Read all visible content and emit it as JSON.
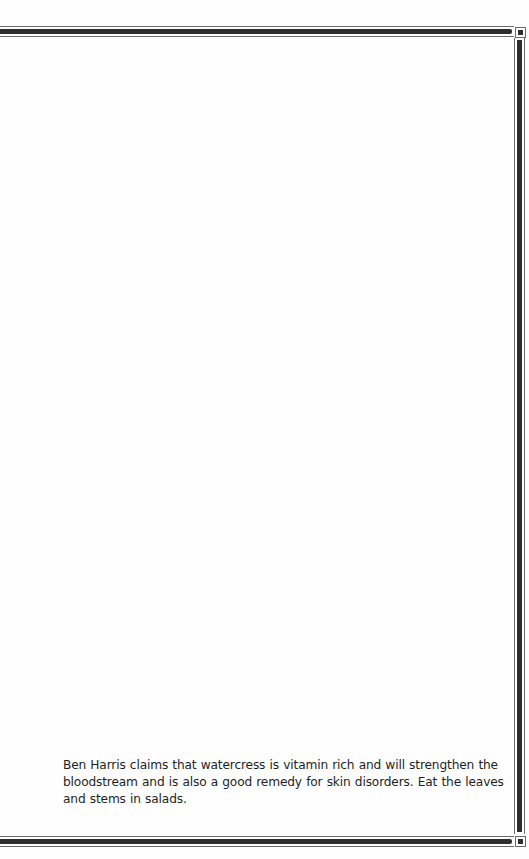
{
  "document": {
    "paragraph": "Ben Harris claims that watercress is vitamin rich and will strengthen the bloodstream and is also a good remedy for skin disorders. Eat the leaves and stems in salads."
  },
  "frame": {
    "style": "double-rule border with corner squares",
    "rule_color": "#2e2e2e",
    "thin_rule_color": "#6a6a6a",
    "background": "#fefefe"
  }
}
